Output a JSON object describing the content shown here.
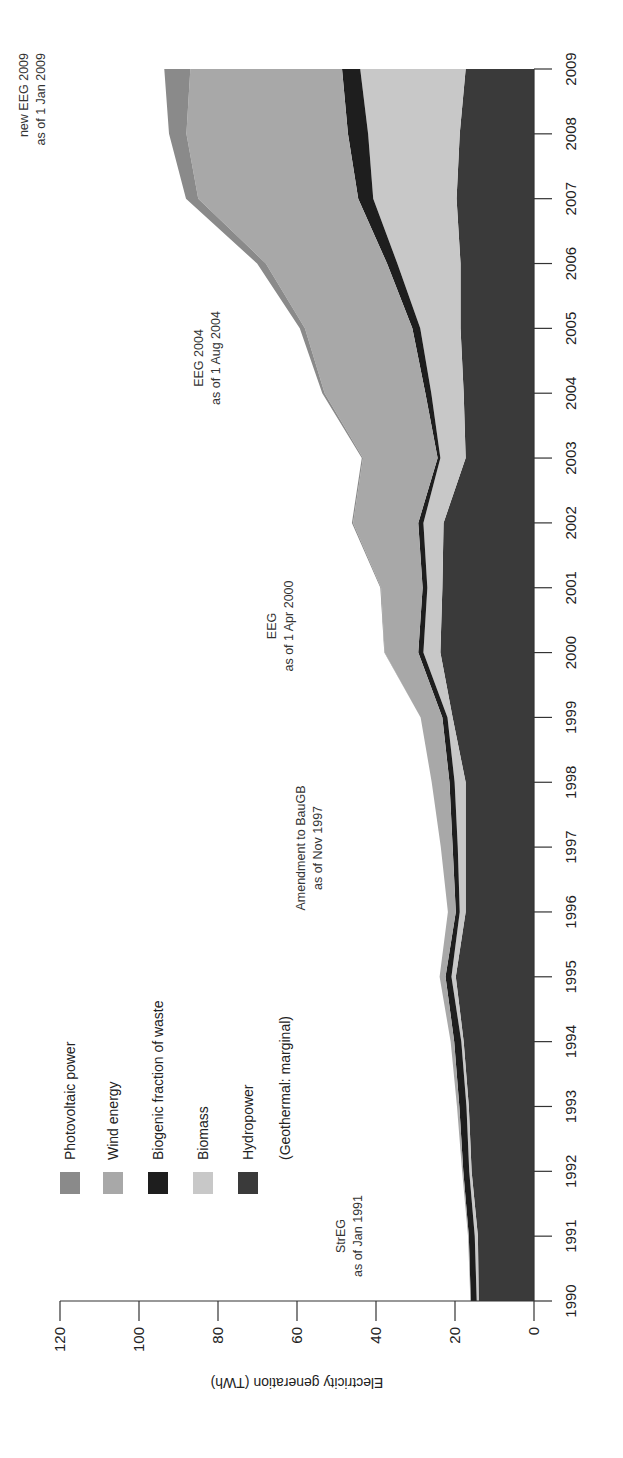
{
  "chart_data": {
    "type": "area",
    "stacked": true,
    "orientation": "rotated-90-ccw",
    "title": "",
    "xlabel": "",
    "ylabel": "Electricity generation (TWh)",
    "ylim": [
      0,
      120
    ],
    "yticks": [
      0,
      20,
      40,
      60,
      80,
      100,
      120
    ],
    "grid": false,
    "legend_position": "upper-left (in rotated view)",
    "categories": [
      "1990",
      "1991",
      "1992",
      "1993",
      "1994",
      "1995",
      "1996",
      "1997",
      "1998",
      "1999",
      "2000",
      "2001",
      "2002",
      "2003",
      "2004",
      "2005",
      "2006",
      "2007",
      "2008",
      "2009"
    ],
    "series": [
      {
        "name": "Hydropower",
        "color": "#3a3a3a",
        "values": [
          14.0,
          14.2,
          15.8,
          16.5,
          17.8,
          19.8,
          17.3,
          17.3,
          17.3,
          20.6,
          23.7,
          23.2,
          22.9,
          17.3,
          17.8,
          18.6,
          18.6,
          19.6,
          18.8,
          17.3
        ]
      },
      {
        "name": "Biomass",
        "color": "#c8c8c8",
        "values": [
          0.5,
          0.8,
          0.6,
          0.6,
          0.6,
          1.1,
          1.5,
          2.0,
          2.8,
          1.3,
          4.3,
          3.8,
          5.1,
          6.4,
          8.2,
          10.2,
          16.0,
          21.1,
          23.2,
          26.7
        ]
      },
      {
        "name": "Biogenic fraction of waste",
        "color": "#1e1e1e",
        "values": [
          1.5,
          1.5,
          1.5,
          1.8,
          1.8,
          1.5,
          1.0,
          1.3,
          1.3,
          1.3,
          1.3,
          1.2,
          1.3,
          0.7,
          1.5,
          2.0,
          2.6,
          3.8,
          5.1,
          4.6
        ]
      },
      {
        "name": "Wind energy",
        "color": "#a8a8a8",
        "values": [
          0.1,
          0.2,
          0.3,
          0.6,
          0.9,
          1.5,
          2.0,
          3.0,
          4.5,
          5.5,
          8.5,
          10.5,
          16.5,
          18.9,
          25.5,
          27.2,
          30.7,
          40.5,
          40.9,
          38.4
        ]
      },
      {
        "name": "Photovoltaic power",
        "color": "#8a8a8a",
        "values": [
          0.0,
          0.0,
          0.0,
          0.0,
          0.0,
          0.0,
          0.0,
          0.0,
          0.0,
          0.0,
          0.1,
          0.2,
          0.3,
          0.3,
          0.6,
          1.3,
          2.2,
          3.1,
          4.4,
          6.6
        ]
      }
    ],
    "annotations": [
      {
        "line1": "StrEG",
        "line2": "as of Jan 1991",
        "year": 1991
      },
      {
        "line1": "Amendment to BauGB",
        "line2": "as of Nov 1997",
        "year": 1997
      },
      {
        "line1": "EEG",
        "line2": "as of 1 Apr 2000",
        "year": 2000
      },
      {
        "line1": "EEG 2004",
        "line2": "as of 1 Aug 2004",
        "year": 2004
      },
      {
        "line1": "new EEG 2009",
        "line2": "as of 1 Jan 2009",
        "year": 2009
      }
    ]
  },
  "legend": {
    "items": [
      {
        "label": "Photovoltaic power",
        "color": "#8a8a8a"
      },
      {
        "label": "Wind energy",
        "color": "#a8a8a8"
      },
      {
        "label": "Biogenic fraction of waste",
        "color": "#1e1e1e"
      },
      {
        "label": "Biomass",
        "color": "#c8c8c8"
      },
      {
        "label": "Hydropower",
        "color": "#3a3a3a"
      }
    ],
    "note": "(Geothermal: marginal)"
  },
  "axis": {
    "ylabel": "Electricity generation (TWh)",
    "yticks": [
      "0",
      "20",
      "40",
      "60",
      "80",
      "100",
      "120"
    ],
    "xticks": [
      "1990",
      "1991",
      "1992",
      "1993",
      "1994",
      "1995",
      "1996",
      "1997",
      "1998",
      "1999",
      "2000",
      "2001",
      "2002",
      "2003",
      "2004",
      "2005",
      "2006",
      "2007",
      "2008",
      "2009"
    ]
  }
}
